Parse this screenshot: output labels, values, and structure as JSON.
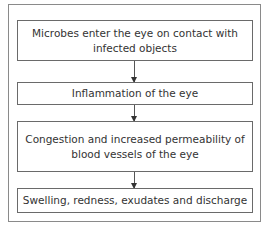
{
  "diagram": {
    "type": "flowchart",
    "steps": [
      {
        "label": "Microbes enter the eye on contact with infected objects"
      },
      {
        "label": "Inflammation of the eye"
      },
      {
        "label": "Congestion and increased permeability of blood vessels of the eye"
      },
      {
        "label": "Swelling, redness, exudates and discharge"
      }
    ]
  }
}
